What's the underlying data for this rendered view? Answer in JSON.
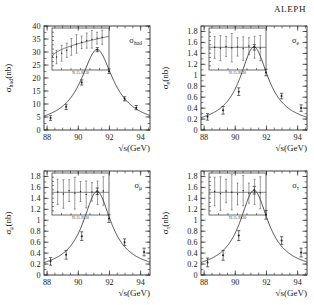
{
  "figure": {
    "experiment": "ALEPH",
    "xlabel": "√s(GeV)",
    "xticks": [
      "88",
      "90",
      "92",
      "94"
    ],
    "inset_range_label": "91.15–91.30"
  },
  "chart_data": [
    {
      "type": "line",
      "id": "hadronic",
      "title": "",
      "panel_label": "σ",
      "panel_label_sub": "had",
      "ylabel": "σ",
      "ylabel_sub": "had",
      "ylabel_unit": "(nb)",
      "xlabel": "√s(GeV)",
      "xlim": [
        87.8,
        94.6
      ],
      "ylim": [
        0,
        40
      ],
      "xticks": [
        88,
        90,
        92,
        94
      ],
      "yticks": [
        0,
        5,
        10,
        15,
        20,
        25,
        30,
        35,
        40
      ],
      "ytick_labels": [
        "0",
        "5",
        "10",
        "15",
        "20",
        "25",
        "30",
        "35",
        "40"
      ],
      "grid": false,
      "peak_x": 91.19,
      "peak_y": 31.0,
      "width_gev": 2.49,
      "points_x": [
        88.22,
        89.22,
        90.22,
        91.22,
        91.97,
        92.97,
        93.72
      ],
      "points_y": [
        4.6,
        8.9,
        18.3,
        30.9,
        22.6,
        12.0,
        8.6
      ],
      "points_err": [
        0.9,
        1.0,
        1.0,
        0.8,
        0.9,
        0.8,
        0.8
      ],
      "inset": {
        "xlabel": "91.15–91.30",
        "x": [
          0.08,
          0.17,
          0.26,
          0.34,
          0.43,
          0.52,
          0.61,
          0.7,
          0.79,
          0.88
        ],
        "y": [
          0.31,
          0.4,
          0.47,
          0.55,
          0.62,
          0.66,
          0.7,
          0.73,
          0.76,
          0.78
        ],
        "err": [
          0.16,
          0.19,
          0.17,
          0.2,
          0.22,
          0.15,
          0.18,
          0.21,
          0.14,
          0.17
        ]
      }
    },
    {
      "type": "line",
      "id": "electron",
      "panel_label": "σ",
      "panel_label_sub": "e",
      "ylabel": "σ",
      "ylabel_sub": "e",
      "ylabel_unit": "(nb)",
      "xlabel": "√s(GeV)",
      "xlim": [
        87.8,
        94.6
      ],
      "ylim": [
        0,
        1.9
      ],
      "xticks": [
        88,
        90,
        92,
        94
      ],
      "yticks": [
        0,
        0.2,
        0.4,
        0.6,
        0.8,
        1,
        1.2,
        1.4,
        1.6,
        1.8
      ],
      "ytick_labels": [
        "0",
        "0.2",
        "0.4",
        "0.6",
        "0.8",
        "1",
        "1.2",
        "1.4",
        "1.6",
        "1.8"
      ],
      "grid": false,
      "peak_x": 91.19,
      "peak_y": 1.52,
      "width_gev": 2.2,
      "points_x": [
        88.22,
        89.22,
        90.22,
        91.22,
        91.97,
        92.97,
        94.22
      ],
      "points_y": [
        0.24,
        0.36,
        0.7,
        1.51,
        1.05,
        0.62,
        0.4
      ],
      "points_err": [
        0.06,
        0.07,
        0.07,
        0.05,
        0.06,
        0.05,
        0.06
      ],
      "inset": {
        "xlabel": "91.15–91.30",
        "x": [
          0.1,
          0.2,
          0.3,
          0.4,
          0.5,
          0.6,
          0.7,
          0.8,
          0.9
        ],
        "y": [
          0.54,
          0.52,
          0.56,
          0.53,
          0.55,
          0.51,
          0.57,
          0.54,
          0.52
        ],
        "err": [
          0.26,
          0.3,
          0.24,
          0.34,
          0.22,
          0.28,
          0.2,
          0.26,
          0.3
        ]
      }
    },
    {
      "type": "line",
      "id": "muon",
      "panel_label": "σ",
      "panel_label_sub": "μ",
      "ylabel": "σ",
      "ylabel_sub": "μ",
      "ylabel_unit": "(nb)",
      "xlabel": "√s(GeV)",
      "xlim": [
        87.8,
        94.6
      ],
      "ylim": [
        0,
        1.9
      ],
      "xticks": [
        88,
        90,
        92,
        94
      ],
      "yticks": [
        0,
        0.2,
        0.4,
        0.6,
        0.8,
        1,
        1.2,
        1.4,
        1.6,
        1.8
      ],
      "ytick_labels": [
        "0",
        "0.2",
        "0.4",
        "0.6",
        "0.8",
        "1",
        "1.2",
        "1.4",
        "1.6",
        "1.8"
      ],
      "grid": false,
      "peak_x": 91.19,
      "peak_y": 1.53,
      "width_gev": 2.2,
      "points_x": [
        88.22,
        89.22,
        90.22,
        91.22,
        91.97,
        92.97,
        94.22
      ],
      "points_y": [
        0.25,
        0.37,
        0.71,
        1.53,
        1.03,
        0.6,
        0.42
      ],
      "points_err": [
        0.07,
        0.08,
        0.08,
        0.06,
        0.07,
        0.06,
        0.07
      ],
      "inset": {
        "xlabel": "91.15–91.30",
        "x": [
          0.1,
          0.2,
          0.3,
          0.4,
          0.5,
          0.6,
          0.7,
          0.8,
          0.9
        ],
        "y": [
          0.55,
          0.5,
          0.58,
          0.52,
          0.56,
          0.49,
          0.55,
          0.53,
          0.57
        ],
        "err": [
          0.3,
          0.34,
          0.26,
          0.38,
          0.24,
          0.32,
          0.22,
          0.28,
          0.34
        ]
      }
    },
    {
      "type": "line",
      "id": "tau",
      "panel_label": "σ",
      "panel_label_sub": "τ",
      "ylabel": "σ",
      "ylabel_sub": "τ",
      "ylabel_unit": "(nb)",
      "xlabel": "√s(GeV)",
      "xlim": [
        87.8,
        94.6
      ],
      "ylim": [
        0,
        1.9
      ],
      "xticks": [
        88,
        90,
        92,
        94
      ],
      "yticks": [
        0,
        0.2,
        0.4,
        0.6,
        0.8,
        1,
        1.2,
        1.4,
        1.6,
        1.8
      ],
      "ytick_labels": [
        "0",
        "0.2",
        "0.4",
        "0.6",
        "0.8",
        "1",
        "1.2",
        "1.4",
        "1.6",
        "1.8"
      ],
      "grid": false,
      "peak_x": 91.19,
      "peak_y": 1.55,
      "width_gev": 2.2,
      "points_x": [
        88.22,
        89.22,
        90.22,
        91.22,
        91.97,
        92.97,
        94.22
      ],
      "points_y": [
        0.23,
        0.36,
        0.72,
        1.55,
        1.1,
        0.63,
        0.41
      ],
      "points_err": [
        0.08,
        0.09,
        0.09,
        0.07,
        0.08,
        0.07,
        0.08
      ],
      "inset": {
        "xlabel": "91.15–91.30",
        "x": [
          0.1,
          0.2,
          0.3,
          0.4,
          0.5,
          0.6,
          0.7,
          0.8,
          0.9
        ],
        "y": [
          0.56,
          0.51,
          0.57,
          0.54,
          0.5,
          0.58,
          0.52,
          0.55,
          0.53
        ],
        "err": [
          0.34,
          0.4,
          0.28,
          0.42,
          0.26,
          0.36,
          0.24,
          0.3,
          0.38
        ]
      }
    }
  ]
}
